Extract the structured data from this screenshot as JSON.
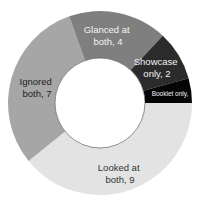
{
  "chart_data": {
    "type": "pie",
    "variant": "donut",
    "title": "",
    "start_angle_deg": 90,
    "direction": "clockwise",
    "categories": [
      "Looked at both",
      "Ignored both",
      "Glanced at both",
      "Showcase only",
      "Booklet only"
    ],
    "values": [
      9,
      7,
      4,
      2,
      1
    ],
    "colors": [
      "#e3e3e3",
      "#a6a6a6",
      "#7f7f7f",
      "#2b2b2b",
      "#050505"
    ],
    "label_colors": [
      "#333333",
      "#222222",
      "#f2f2f2",
      "#f2f2f2",
      "#f2f2f2"
    ],
    "labels": [
      {
        "line1": "Looked at",
        "line2": "both, 9"
      },
      {
        "line1": "Ignored",
        "line2": "both, 7"
      },
      {
        "line1": "Glanced at",
        "line2": "both, 4"
      },
      {
        "line1": "Showcase",
        "line2": "only, 2"
      },
      {
        "line1": "Booklet only,",
        "line2": ""
      }
    ],
    "legend": "none"
  }
}
